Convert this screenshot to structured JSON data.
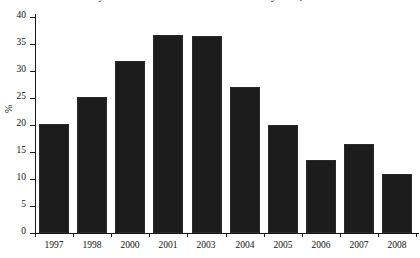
{
  "chart_data": {
    "type": "bar",
    "title": "Poverty Measure as the % of Official Poverty Line, 1997-2008",
    "xlabel": "",
    "ylabel": "%",
    "categories": [
      "1997",
      "1998",
      "2000",
      "2001",
      "2003",
      "2004",
      "2005",
      "2006",
      "2007",
      "2008"
    ],
    "values": [
      20.1,
      25.2,
      31.8,
      36.6,
      36.4,
      27.0,
      20.0,
      13.5,
      16.4,
      11.0
    ],
    "ylim": [
      0,
      40
    ],
    "yticks": [
      0,
      5,
      10,
      15,
      20,
      25,
      30,
      35,
      40
    ],
    "ytick_labels": [
      "0",
      "5",
      "10",
      "15",
      "20",
      "25",
      "30",
      "35",
      "40"
    ],
    "grid": false,
    "legend": false,
    "bar_color": "#1c1c1c",
    "axis_color": "#1a1a1a",
    "background": "#ffffff"
  }
}
